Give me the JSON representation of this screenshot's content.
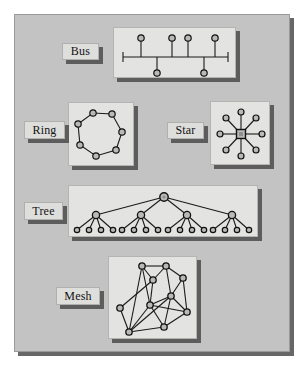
{
  "figure": {
    "background_color": "#ffffff",
    "board_color": "#c3c3c3",
    "panel_color": "#e3e3e1",
    "shadow_color": "#5d5d5d",
    "line_color": "#1a1a1a",
    "node_fill": "#b9b9b9",
    "node_stroke": "#111111"
  },
  "sections": [
    {
      "id": "bus",
      "label": "Bus",
      "label_box": {
        "x": 62,
        "y": 43,
        "w": 37,
        "h": 17
      },
      "panel": {
        "x": 113,
        "y": 27,
        "w": 123,
        "h": 51
      },
      "diagram": {
        "type": "bus",
        "backbone": {
          "x1": 9,
          "y1": 29,
          "x2": 114,
          "y2": 29
        },
        "terminators": [
          {
            "x": 9,
            "y1": 24,
            "y2": 34
          },
          {
            "x": 114,
            "y1": 24,
            "y2": 34
          }
        ],
        "nodes_above": [
          {
            "x": 27,
            "y": 10
          },
          {
            "x": 58,
            "y": 10
          },
          {
            "x": 74,
            "y": 10
          },
          {
            "x": 101,
            "y": 10
          }
        ],
        "nodes_below": [
          {
            "x": 43,
            "y": 45
          },
          {
            "x": 90,
            "y": 45
          }
        ],
        "node_radius": 3.2
      }
    },
    {
      "id": "ring",
      "label": "Ring",
      "label_box": {
        "x": 24,
        "y": 121,
        "w": 41,
        "h": 18
      },
      "panel": {
        "x": 68,
        "y": 102,
        "w": 66,
        "h": 64
      },
      "diagram": {
        "type": "ring",
        "node_count": 7,
        "nodes": [
          {
            "x": 24,
            "y": 10
          },
          {
            "x": 43,
            "y": 11
          },
          {
            "x": 53,
            "y": 29
          },
          {
            "x": 47,
            "y": 47
          },
          {
            "x": 27,
            "y": 53
          },
          {
            "x": 11,
            "y": 42
          },
          {
            "x": 9,
            "y": 21
          }
        ],
        "node_radius": 3.2
      }
    },
    {
      "id": "star",
      "label": "Star",
      "label_box": {
        "x": 167,
        "y": 122,
        "w": 37,
        "h": 17
      },
      "panel": {
        "x": 210,
        "y": 101,
        "w": 60,
        "h": 64
      },
      "diagram": {
        "type": "star",
        "hub": {
          "x": 30,
          "y": 32,
          "size": 5
        },
        "spokes": 8,
        "nodes": [
          {
            "x": 30,
            "y": 10
          },
          {
            "x": 45,
            "y": 16
          },
          {
            "x": 51,
            "y": 32
          },
          {
            "x": 45,
            "y": 48
          },
          {
            "x": 30,
            "y": 54
          },
          {
            "x": 15,
            "y": 48
          },
          {
            "x": 9,
            "y": 32
          },
          {
            "x": 15,
            "y": 16
          }
        ],
        "node_radius": 3
      }
    },
    {
      "id": "tree",
      "label": "Tree",
      "label_box": {
        "x": 24,
        "y": 202,
        "w": 39,
        "h": 18
      },
      "panel": {
        "x": 68,
        "y": 185,
        "w": 190,
        "h": 52
      },
      "diagram": {
        "type": "tree",
        "root": {
          "x": 95,
          "y": 11
        },
        "root_radius": 4.2,
        "branches": [
          {
            "x": 27,
            "y": 29
          },
          {
            "x": 72,
            "y": 29
          },
          {
            "x": 118,
            "y": 29
          },
          {
            "x": 163,
            "y": 29
          }
        ],
        "branch_radius": 3.6,
        "leaf_radius": 2.7,
        "leaf_y": 44,
        "leaves": [
          8,
          20,
          32,
          44,
          53,
          65,
          77,
          89,
          99,
          111,
          123,
          135,
          144,
          156,
          168,
          180
        ],
        "leaf_groups": 4,
        "leaves_per_group": 4
      }
    },
    {
      "id": "mesh",
      "label": "Mesh",
      "label_box": {
        "x": 56,
        "y": 287,
        "w": 44,
        "h": 18
      },
      "panel": {
        "x": 108,
        "y": 256,
        "w": 89,
        "h": 83
      },
      "diagram": {
        "type": "mesh",
        "node_radius": 3.2,
        "nodes": [
          {
            "id": 0,
            "x": 33,
            "y": 9
          },
          {
            "id": 1,
            "x": 57,
            "y": 9
          },
          {
            "id": 2,
            "x": 44,
            "y": 23
          },
          {
            "id": 3,
            "x": 74,
            "y": 21
          },
          {
            "id": 4,
            "x": 62,
            "y": 39
          },
          {
            "id": 5,
            "x": 41,
            "y": 48
          },
          {
            "id": 6,
            "x": 11,
            "y": 51
          },
          {
            "id": 7,
            "x": 78,
            "y": 55
          },
          {
            "id": 8,
            "x": 55,
            "y": 70
          },
          {
            "id": 9,
            "x": 20,
            "y": 75
          },
          {
            "id": 10,
            "x": 28,
            "y": 35
          }
        ],
        "edges": [
          [
            0,
            1
          ],
          [
            0,
            2
          ],
          [
            1,
            2
          ],
          [
            1,
            3
          ],
          [
            1,
            4
          ],
          [
            3,
            4
          ],
          [
            3,
            7
          ],
          [
            2,
            5
          ],
          [
            0,
            9
          ],
          [
            4,
            5
          ],
          [
            4,
            7
          ],
          [
            4,
            8
          ],
          [
            5,
            7
          ],
          [
            5,
            8
          ],
          [
            5,
            9
          ],
          [
            6,
            9
          ],
          [
            6,
            2
          ],
          [
            8,
            9
          ],
          [
            9,
            4
          ],
          [
            7,
            8
          ],
          [
            0,
            5
          ]
        ]
      }
    }
  ]
}
